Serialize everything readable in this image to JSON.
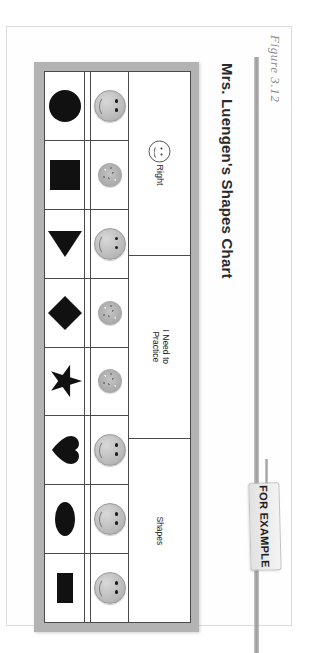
{
  "figure": {
    "label": "Figure 3.12"
  },
  "chart": {
    "title": "Mrs. Luengen's Shapes Chart",
    "columns": [
      {
        "id": "right",
        "label": "Right",
        "icon": "smiley-face-outline-icon"
      },
      {
        "id": "practice",
        "label": "I Need to Practice",
        "icon": null
      },
      {
        "id": "shapes",
        "label": "Shapes",
        "icon": null
      }
    ],
    "rows": [
      {
        "shape": "circle",
        "shape_icon": "circle-shape-icon",
        "practice": "",
        "right": "smiley-sticker"
      },
      {
        "shape": "square",
        "shape_icon": "square-shape-icon",
        "practice": "",
        "right": "plain-dot-sticker"
      },
      {
        "shape": "triangle",
        "shape_icon": "triangle-shape-icon",
        "practice": "",
        "right": "smiley-sticker"
      },
      {
        "shape": "diamond",
        "shape_icon": "diamond-shape-icon",
        "practice": "",
        "right": "plain-dot-sticker"
      },
      {
        "shape": "star",
        "shape_icon": "star-shape-icon",
        "practice": "",
        "right": "plain-dot-sticker"
      },
      {
        "shape": "heart",
        "shape_icon": "heart-shape-icon",
        "practice": "",
        "right": "smiley-sticker"
      },
      {
        "shape": "oval",
        "shape_icon": "oval-shape-icon",
        "practice": "",
        "right": "smiley-sticker"
      },
      {
        "shape": "rectangle",
        "shape_icon": "rectangle-shape-icon",
        "practice": "",
        "right": "smiley-sticker"
      }
    ]
  },
  "callout": {
    "label": "FOR EXAMPLE"
  },
  "colors": {
    "frame_gray": "#b3b3b3",
    "grid_line": "#4a4a4a",
    "shape_fill": "#111111",
    "sticker_gray": "#b8b8b8",
    "page_background": "#fefefe"
  }
}
